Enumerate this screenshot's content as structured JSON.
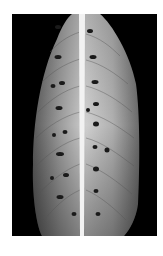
{
  "image": {
    "subject": "leaf with dark spots along midrib",
    "style": "black-and-white photograph",
    "background_color": "#000000",
    "border_color": "#ffffff",
    "leaf_color": "#b8b8b8",
    "midrib_color": "#f2f2f2",
    "spot_color": "#1a1a1a",
    "spots": [
      {
        "cx": 58,
        "cy": 27,
        "rx": 3,
        "ry": 2
      },
      {
        "cx": 78,
        "cy": 31,
        "rx": 3,
        "ry": 2
      },
      {
        "cx": 58,
        "cy": 57,
        "rx": 3.5,
        "ry": 2
      },
      {
        "cx": 81,
        "cy": 57,
        "rx": 3.5,
        "ry": 2
      },
      {
        "cx": 53,
        "cy": 86,
        "rx": 2.5,
        "ry": 2
      },
      {
        "cx": 62,
        "cy": 83,
        "rx": 3,
        "ry": 2
      },
      {
        "cx": 83,
        "cy": 82,
        "rx": 3.5,
        "ry": 2
      },
      {
        "cx": 59,
        "cy": 108,
        "rx": 3.5,
        "ry": 2
      },
      {
        "cx": 78,
        "cy": 108,
        "rx": 2,
        "ry": 2
      },
      {
        "cx": 84,
        "cy": 104,
        "rx": 3,
        "ry": 2
      },
      {
        "cx": 54,
        "cy": 135,
        "rx": 2,
        "ry": 2
      },
      {
        "cx": 65,
        "cy": 132,
        "rx": 2.5,
        "ry": 2
      },
      {
        "cx": 84,
        "cy": 124,
        "rx": 3,
        "ry": 2.5
      },
      {
        "cx": 83,
        "cy": 147,
        "rx": 2.5,
        "ry": 2
      },
      {
        "cx": 95,
        "cy": 150,
        "rx": 2.5,
        "ry": 2.5
      },
      {
        "cx": 60,
        "cy": 154,
        "rx": 4,
        "ry": 2
      },
      {
        "cx": 84,
        "cy": 169,
        "rx": 3,
        "ry": 2.5
      },
      {
        "cx": 52,
        "cy": 178,
        "rx": 2,
        "ry": 2
      },
      {
        "cx": 66,
        "cy": 175,
        "rx": 3,
        "ry": 2
      },
      {
        "cx": 84,
        "cy": 191,
        "rx": 2.5,
        "ry": 2
      },
      {
        "cx": 60,
        "cy": 197,
        "rx": 3.5,
        "ry": 2
      },
      {
        "cx": 72,
        "cy": 212,
        "rx": 2.5,
        "ry": 2
      },
      {
        "cx": 90,
        "cy": 212,
        "rx": 2.5,
        "ry": 2
      }
    ]
  }
}
